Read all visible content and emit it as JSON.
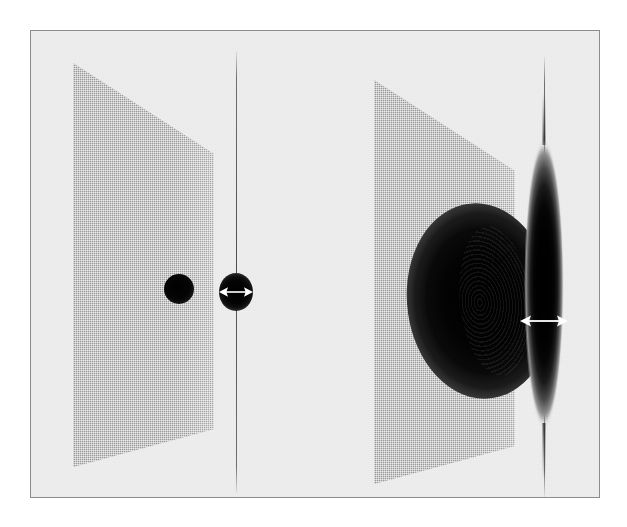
{
  "figure": {
    "kind": "scientific-figure",
    "canvas": {
      "width": 627,
      "height": 527
    },
    "background_color": "#ffffff",
    "plate": {
      "background_color": "#eeeeee",
      "border_color": "#8c8c8c",
      "x": 30,
      "y": 30,
      "width": 570,
      "height": 468
    }
  },
  "palette": {
    "paper": "#ffffff",
    "plate_fill": "#eeeeee",
    "frame_line": "#8c8c8c",
    "plane_gray": "#a8a8a8",
    "intensity_peak": "#000000",
    "arrow_white": "#ffffff",
    "axis_gray": "#555555"
  },
  "panels": [
    {
      "id": "panel-a",
      "label": "left-panel",
      "plane": {
        "name": "transverse-plane-left",
        "fill_color": "#a8a8a8",
        "texture": "dithered-halftone-grid",
        "shape": "perspective-trapezoid",
        "corners_px": [
          [
            72,
            62
          ],
          [
            213,
            153
          ],
          [
            213,
            428
          ],
          [
            72,
            466
          ]
        ]
      },
      "spot": {
        "name": "transverse-spot-left",
        "shape": "circular",
        "relative_size": "small",
        "center_px": [
          178,
          288
        ],
        "diameter_px": 30,
        "peak_color": "#000000"
      },
      "axis": {
        "name": "longitudinal-axis-left",
        "orientation": "vertical",
        "x_px": 235,
        "y_top_px": 50,
        "y_bottom_px": 492,
        "color": "#555555"
      },
      "envelope": {
        "name": "longitudinal-envelope-left",
        "shape": "compact-round-waist",
        "center_px": [
          235,
          291
        ],
        "width_px": 34,
        "height_px": 38
      },
      "width_marker": {
        "name": "width-arrow-left",
        "style": "double-headed-horizontal",
        "color": "#ffffff",
        "center_px": [
          235,
          291
        ],
        "span_px": 30
      }
    },
    {
      "id": "panel-b",
      "label": "right-panel",
      "plane": {
        "name": "transverse-plane-right",
        "fill_color": "#a8a8a8",
        "texture": "dithered-halftone-grid",
        "shape": "perspective-trapezoid",
        "corners_px": [
          [
            373,
            79
          ],
          [
            514,
            170
          ],
          [
            514,
            445
          ],
          [
            373,
            483
          ]
        ]
      },
      "spot": {
        "name": "transverse-spot-right",
        "shape": "elliptical-with-concentric-fringes",
        "relative_size": "large",
        "center_px": [
          479,
          300
        ],
        "width_px": 146,
        "height_px": 196,
        "peak_color": "#000000",
        "fringes": "concentric-interference-rings"
      },
      "axis": {
        "name": "longitudinal-axis-right",
        "orientation": "vertical",
        "x_px": 543,
        "y_top_px": 56,
        "y_bottom_px": 496,
        "color": "#555555"
      },
      "envelope": {
        "name": "longitudinal-envelope-right",
        "shape": "elongated-spindle-lens",
        "center_px": [
          543,
          283
        ],
        "width_px": 40,
        "height_px": 290
      },
      "width_marker": {
        "name": "width-arrow-right",
        "style": "double-headed-horizontal",
        "color": "#ffffff",
        "center_px": [
          543,
          320
        ],
        "span_px": 44
      }
    }
  ]
}
